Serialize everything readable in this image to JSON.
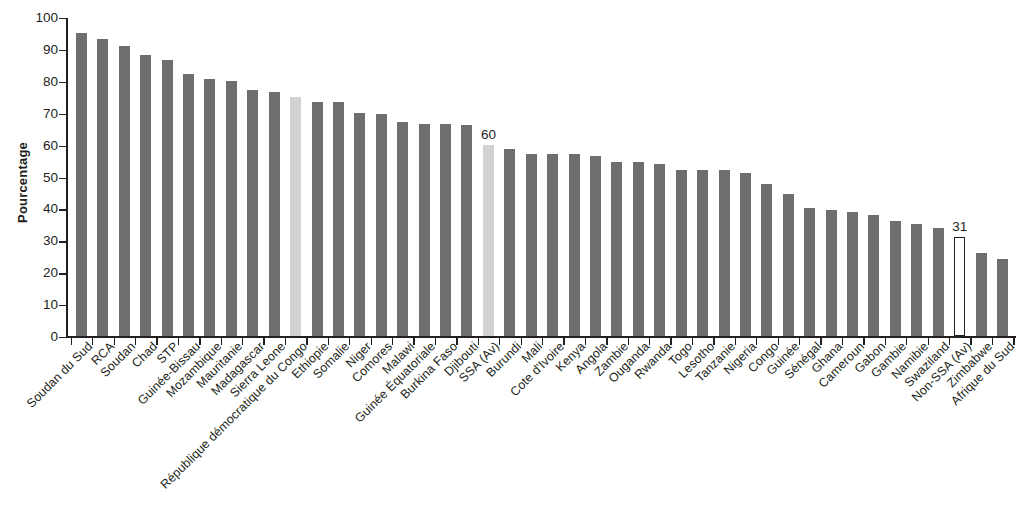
{
  "chart_data": {
    "type": "bar",
    "title": "",
    "xlabel": "",
    "ylabel": "Pourcentage",
    "ylim": [
      0,
      100
    ],
    "yticks": [
      0,
      10,
      20,
      30,
      40,
      50,
      60,
      70,
      80,
      90,
      100
    ],
    "grid": false,
    "legend": null,
    "categories": [
      "Soudan du Sud",
      "RCA",
      "Soudan",
      "Chad",
      "STP",
      "Guinée-Bissau",
      "Mozambique",
      "Mauritanie",
      "Madagascar",
      "Sierra Leone",
      "République démocratique du Congo",
      "Ethiopie",
      "Somalie",
      "Niger",
      "Comores",
      "Malawi",
      "Guinée Équatoriale",
      "Burkina Faso",
      "Djibouti",
      "SSA (Av)",
      "Burundi",
      "Mali",
      "Cote d'Ivoire",
      "Kenya",
      "Angola",
      "Zambie",
      "Ouganda",
      "Rwanda",
      "Togo",
      "Lesotho",
      "Tanzanie",
      "Nigeria",
      "Congo",
      "Guinée",
      "Sénégal",
      "Ghana",
      "Cameroun",
      "Gabon",
      "Gambie",
      "Namibie",
      "Swaziland",
      "Non-SSA (Av)",
      "Zimbabwe",
      "Afrique du Sud"
    ],
    "values": [
      95,
      93,
      91,
      88,
      86.5,
      82,
      80.5,
      80,
      77,
      76.5,
      75,
      73.5,
      73.5,
      70,
      69.5,
      67,
      66.5,
      66.5,
      66,
      60,
      58.5,
      57,
      57,
      57,
      56.5,
      54.5,
      54.5,
      54,
      52,
      52,
      52,
      51,
      47.5,
      44.5,
      40,
      39.5,
      39,
      38,
      36,
      35,
      34,
      31,
      26,
      24
    ],
    "bar_styles": [
      "dark",
      "dark",
      "dark",
      "dark",
      "dark",
      "dark",
      "dark",
      "dark",
      "dark",
      "dark",
      "light",
      "dark",
      "dark",
      "dark",
      "dark",
      "dark",
      "dark",
      "dark",
      "dark",
      "light",
      "dark",
      "dark",
      "dark",
      "dark",
      "dark",
      "dark",
      "dark",
      "dark",
      "dark",
      "dark",
      "dark",
      "dark",
      "dark",
      "dark",
      "dark",
      "dark",
      "dark",
      "dark",
      "dark",
      "dark",
      "dark",
      "hollow",
      "dark",
      "dark"
    ],
    "annotations": [
      {
        "category": "SSA (Av)",
        "index": 19,
        "text": "60"
      },
      {
        "category": "Non-SSA (Av)",
        "index": 41,
        "text": "31"
      }
    ],
    "colors": {
      "bar_dark": "#6e6e6e",
      "bar_light": "#d2d2d2",
      "bar_hollow_fill": "#ffffff",
      "axis": "#231f20",
      "text": "#231f20",
      "background": "#ffffff"
    }
  }
}
